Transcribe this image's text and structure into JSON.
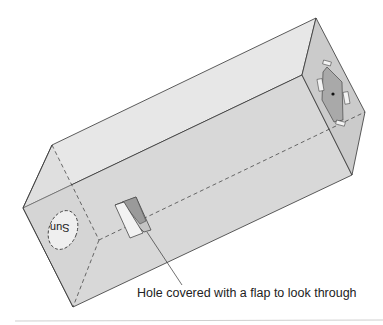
{
  "diagram": {
    "sun_label": "Sun",
    "caption": "Hole covered with a flap to look through",
    "colors": {
      "top_face": "#e6e6e6",
      "front_face": "#d6d6d6",
      "end_face_left": "#cfcfcf",
      "end_face_right": "#cdcdcd",
      "outline": "#333333",
      "flap_dark": "#9a9a9a",
      "flap_light": "#c4c4c4",
      "sun_fill": "#eeeeee",
      "foil": "#a8a8a8"
    }
  }
}
